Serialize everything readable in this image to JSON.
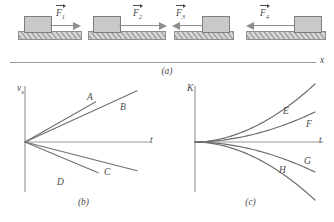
{
  "figure": {
    "panels": [
      {
        "id": "a",
        "caption": "(a)"
      },
      {
        "id": "b",
        "caption": "(b)"
      },
      {
        "id": "c",
        "caption": "(c)"
      }
    ]
  },
  "panel_a": {
    "axis_label": "x",
    "blocks": [
      {
        "force_label": "F",
        "subscript": "1",
        "direction": "right",
        "arrow_length": "short",
        "block_position": "left"
      },
      {
        "force_label": "F",
        "subscript": "2",
        "direction": "right",
        "arrow_length": "long",
        "block_position": "left"
      },
      {
        "force_label": "F",
        "subscript": "3",
        "direction": "left",
        "arrow_length": "short",
        "block_position": "right"
      },
      {
        "force_label": "F",
        "subscript": "4",
        "direction": "left",
        "arrow_length": "long",
        "block_position": "right"
      }
    ]
  },
  "chart_data": [
    {
      "id": "b",
      "type": "line",
      "title": "",
      "xlabel": "t",
      "ylabel": "v_x",
      "ylabel_base": "v",
      "ylabel_sub": "x",
      "grid": false,
      "axis_origin_shared": true,
      "description": "Velocity versus time: four straight lines through the origin with different slopes",
      "series": [
        {
          "name": "A",
          "slope": 0.62,
          "x_end": 0.6,
          "label_x": 0.63,
          "label_y": 0.41
        },
        {
          "name": "B",
          "slope": 0.5,
          "x_end": 0.95,
          "label_x": 0.86,
          "label_y": 0.41
        },
        {
          "name": "C",
          "slope": -0.28,
          "x_end": 0.95,
          "label_x": 0.72,
          "label_y": -0.2
        },
        {
          "name": "D",
          "slope": -0.46,
          "x_end": 0.62,
          "label_x": 0.37,
          "label_y": -0.24
        }
      ],
      "xlim": [
        0,
        1
      ],
      "ylim": [
        -0.45,
        0.62
      ]
    },
    {
      "id": "c",
      "type": "line",
      "title": "",
      "xlabel": "t",
      "ylabel": "K",
      "grid": false,
      "axis_origin_shared": true,
      "description": "Kinetic energy versus time: four curves fanning out from the origin, two rising and two falling",
      "series": [
        {
          "name": "E",
          "curvature": "concave-up-steep",
          "end_value": 0.58,
          "label_x": 0.78,
          "label_y": 0.52
        },
        {
          "name": "F",
          "curvature": "concave-up-shallow",
          "end_value": 0.3,
          "label_x": 0.92,
          "label_y": 0.36
        },
        {
          "name": "G",
          "curvature": "concave-down-shallow",
          "end_value": -0.3,
          "label_x": 0.92,
          "label_y": -0.35
        },
        {
          "name": "H",
          "curvature": "concave-down-steep",
          "end_value": -0.58,
          "label_x": 0.74,
          "label_y": -0.5
        }
      ],
      "xlim": [
        0,
        1
      ],
      "ylim": [
        -0.62,
        0.62
      ]
    }
  ],
  "colors": {
    "line": "#6f6f6f",
    "axis": "#9a9a9a",
    "text": "#4a4a4a",
    "block_fill": "#c9c9c9",
    "block_stroke": "#7d7d7d",
    "ground_fill": "#d6d6d6",
    "arrow": "#8d8d8d"
  }
}
